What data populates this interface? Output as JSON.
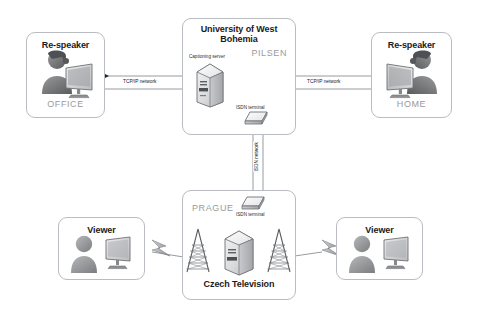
{
  "diagram": {
    "background_color": "#ffffff",
    "box_border_color": "#b9bcc0",
    "city_label_color": "#9a9a9a",
    "line_color": "#8b9096"
  },
  "nodes": {
    "office": {
      "title": "Re-speaker",
      "city": "OFFICE",
      "icon": "person-at-computer-icon"
    },
    "home": {
      "title": "Re-speaker",
      "city": "HOME",
      "icon": "person-at-computer-icon"
    },
    "university": {
      "title_line1": "University of West",
      "title_line2": "Bohemia",
      "city": "PILSEN",
      "server_label": "Captioning server",
      "terminal_label": "ISDN terminal",
      "server_icon": "tower-server-icon",
      "terminal_icon": "isdn-terminal-icon"
    },
    "television": {
      "title": "Czech Television",
      "city": "PRAGUE",
      "terminal_label": "ISDN terminal",
      "terminal_icon": "isdn-terminal-icon",
      "server_icon": "tower-server-icon",
      "antenna_icon": "broadcast-antenna-icon"
    },
    "viewer_left": {
      "title": "Viewer",
      "icon": "person-with-tv-icon"
    },
    "viewer_right": {
      "title": "Viewer",
      "icon": "person-with-tv-icon"
    }
  },
  "links": [
    {
      "id": "office-university",
      "label": "TCP/IP network",
      "direction": "bidirectional"
    },
    {
      "id": "university-home",
      "label": "TCP/IP network",
      "direction": "bidirectional"
    },
    {
      "id": "pilsen-prague",
      "label": "ISDN network",
      "direction": "bidirectional"
    },
    {
      "id": "tv-viewer-left",
      "label": "",
      "direction": "broadcast"
    },
    {
      "id": "tv-viewer-right",
      "label": "",
      "direction": "broadcast"
    }
  ]
}
